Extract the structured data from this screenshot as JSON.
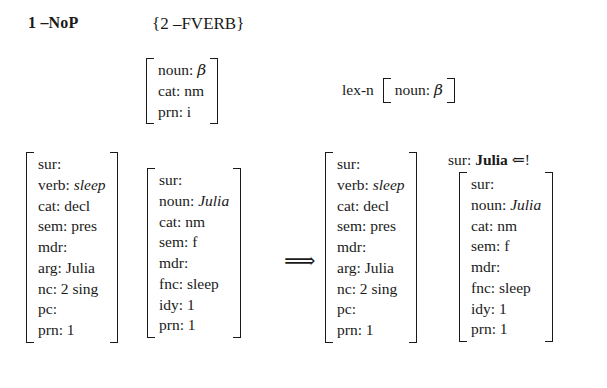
{
  "figure": {
    "kind": "lexical-rule-application-diagram",
    "left_rule_label": "1 –NoP",
    "right_rule_pattern": "{2 –FVERB}",
    "operators": {
      "derives": "⟹",
      "consume_left": "⇐",
      "bang": "!"
    },
    "lex_label": "lex-n"
  },
  "pattern_avm": {
    "rows": [
      {
        "attr": "noun:",
        "val": "β",
        "style": "greek"
      },
      {
        "attr": "cat:",
        "val": "nm",
        "style": "plain"
      },
      {
        "attr": "prn:",
        "val": "i",
        "style": "plain"
      }
    ]
  },
  "lex_avm": {
    "rows": [
      {
        "attr": "noun:",
        "val": "β",
        "style": "greek"
      }
    ]
  },
  "input": {
    "verb_avm": {
      "rows": [
        {
          "attr": "sur:",
          "val": "",
          "style": "plain"
        },
        {
          "attr": "verb:",
          "val": "sleep",
          "style": "italic"
        },
        {
          "attr": "cat:",
          "val": "decl",
          "style": "plain"
        },
        {
          "attr": "sem:",
          "val": "pres",
          "style": "plain"
        },
        {
          "attr": "mdr:",
          "val": "",
          "style": "plain"
        },
        {
          "attr": "arg:",
          "val": "Julia",
          "style": "plain"
        },
        {
          "attr": "nc:",
          "val": "2 sing",
          "style": "plain"
        },
        {
          "attr": "pc:",
          "val": "",
          "style": "plain"
        },
        {
          "attr": "prn:",
          "val": "1",
          "style": "plain"
        }
      ]
    },
    "noun_avm": {
      "rows": [
        {
          "attr": "sur:",
          "val": "",
          "style": "plain"
        },
        {
          "attr": "noun:",
          "val": "Julia",
          "style": "italic"
        },
        {
          "attr": "cat:",
          "val": "nm",
          "style": "plain"
        },
        {
          "attr": "sem:",
          "val": "f",
          "style": "plain"
        },
        {
          "attr": "mdr:",
          "val": "",
          "style": "plain"
        },
        {
          "attr": "fnc:",
          "val": "sleep",
          "style": "plain"
        },
        {
          "attr": "idy:",
          "val": "1",
          "style": "plain"
        },
        {
          "attr": "prn:",
          "val": "1",
          "style": "plain"
        }
      ]
    }
  },
  "output": {
    "verb_avm": {
      "rows": [
        {
          "attr": "sur:",
          "val": "",
          "style": "plain"
        },
        {
          "attr": "verb:",
          "val": "sleep",
          "style": "italic"
        },
        {
          "attr": "cat:",
          "val": "decl",
          "style": "plain"
        },
        {
          "attr": "sem:",
          "val": "pres",
          "style": "plain"
        },
        {
          "attr": "mdr:",
          "val": "",
          "style": "plain"
        },
        {
          "attr": "arg:",
          "val": "Julia",
          "style": "plain"
        },
        {
          "attr": "nc:",
          "val": "2 sing",
          "style": "plain"
        },
        {
          "attr": "pc:",
          "val": "",
          "style": "plain"
        },
        {
          "attr": "prn:",
          "val": "1",
          "style": "plain"
        }
      ]
    },
    "noun_head": {
      "attr": "sur:",
      "val": "Julia",
      "marker": "⇐!"
    },
    "noun_avm": {
      "rows": [
        {
          "attr": "sur:",
          "val": "",
          "style": "plain"
        },
        {
          "attr": "noun:",
          "val": "Julia",
          "style": "italic"
        },
        {
          "attr": "cat:",
          "val": "nm",
          "style": "plain"
        },
        {
          "attr": "sem:",
          "val": "f",
          "style": "plain"
        },
        {
          "attr": "mdr:",
          "val": "",
          "style": "plain"
        },
        {
          "attr": "fnc:",
          "val": "sleep",
          "style": "plain"
        },
        {
          "attr": "idy:",
          "val": "1",
          "style": "plain"
        },
        {
          "attr": "prn:",
          "val": "1",
          "style": "plain"
        }
      ]
    }
  },
  "colors": {
    "ink": "#1a1a1a",
    "page": "#ffffff"
  }
}
